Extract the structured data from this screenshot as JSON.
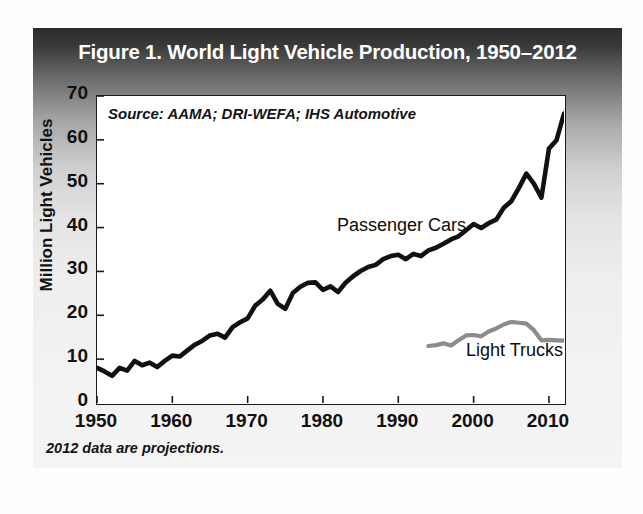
{
  "figure": {
    "title": "Figure 1. World Light Vehicle Production, 1950–2012",
    "source_note": "Source: AAMA; DRI-WEFA; IHS Automotive",
    "footnote": "2012 data are projections."
  },
  "chart_data": {
    "type": "line",
    "title": "Figure 1. World Light Vehicle Production, 1950–2012",
    "xlabel": "",
    "ylabel": "Million Light Vehicles",
    "xlim": [
      1950,
      2012
    ],
    "ylim": [
      0,
      70
    ],
    "xticks": [
      1950,
      1960,
      1970,
      1980,
      1990,
      2000,
      2010
    ],
    "yticks": [
      0,
      10,
      20,
      30,
      40,
      50,
      60,
      70
    ],
    "grid": false,
    "legend": "inline-annotations",
    "annotations": [
      {
        "text": "Passenger Cars",
        "x": 1988,
        "y": 38.5
      },
      {
        "text": "Light Trucks",
        "x": 2002,
        "y": 11.5
      },
      {
        "text": "Source: AAMA; DRI-WEFA; IHS Automotive",
        "x": 1951.5,
        "y": 66.5
      }
    ],
    "series": [
      {
        "name": "Passenger Cars",
        "color": "#111111",
        "x": [
          1950,
          1951,
          1952,
          1953,
          1954,
          1955,
          1956,
          1957,
          1958,
          1959,
          1960,
          1961,
          1962,
          1963,
          1964,
          1965,
          1966,
          1967,
          1968,
          1969,
          1970,
          1971,
          1972,
          1973,
          1974,
          1975,
          1976,
          1977,
          1978,
          1979,
          1980,
          1981,
          1982,
          1983,
          1984,
          1985,
          1986,
          1987,
          1988,
          1989,
          1990,
          1991,
          1992,
          1993,
          1994,
          1995,
          1996,
          1997,
          1998,
          1999,
          2000,
          2001,
          2002,
          2003,
          2004,
          2005,
          2006,
          2007,
          2008,
          2009,
          2010,
          2011,
          2012
        ],
        "y": [
          8.0,
          7.2,
          6.2,
          8.0,
          7.4,
          9.6,
          8.6,
          9.2,
          8.2,
          9.6,
          10.8,
          10.6,
          12.0,
          13.3,
          14.2,
          15.4,
          15.8,
          14.9,
          17.3,
          18.4,
          19.3,
          22.2,
          23.6,
          25.6,
          22.6,
          21.5,
          25.1,
          26.5,
          27.4,
          27.5,
          25.8,
          26.6,
          25.3,
          27.4,
          28.9,
          30.1,
          31.0,
          31.5,
          32.8,
          33.5,
          33.8,
          32.8,
          34.0,
          33.5,
          34.8,
          35.4,
          36.3,
          37.3,
          38.0,
          39.4,
          40.8,
          39.9,
          41.0,
          41.8,
          44.5,
          46.0,
          49.0,
          52.3,
          50.0,
          46.8,
          58.0,
          59.9,
          66.0
        ]
      },
      {
        "name": "Light Trucks",
        "color": "#8c8c8c",
        "x": [
          1994,
          1995,
          1996,
          1997,
          1998,
          1999,
          2000,
          2001,
          2002,
          2003,
          2004,
          2005,
          2006,
          2007,
          2008,
          2009,
          2010,
          2011,
          2012
        ],
        "y": [
          13.0,
          13.2,
          13.6,
          13.1,
          14.3,
          15.4,
          15.5,
          15.2,
          16.3,
          17.0,
          17.9,
          18.5,
          18.3,
          18.1,
          16.6,
          14.3,
          14.4,
          14.3,
          14.2
        ]
      }
    ]
  }
}
